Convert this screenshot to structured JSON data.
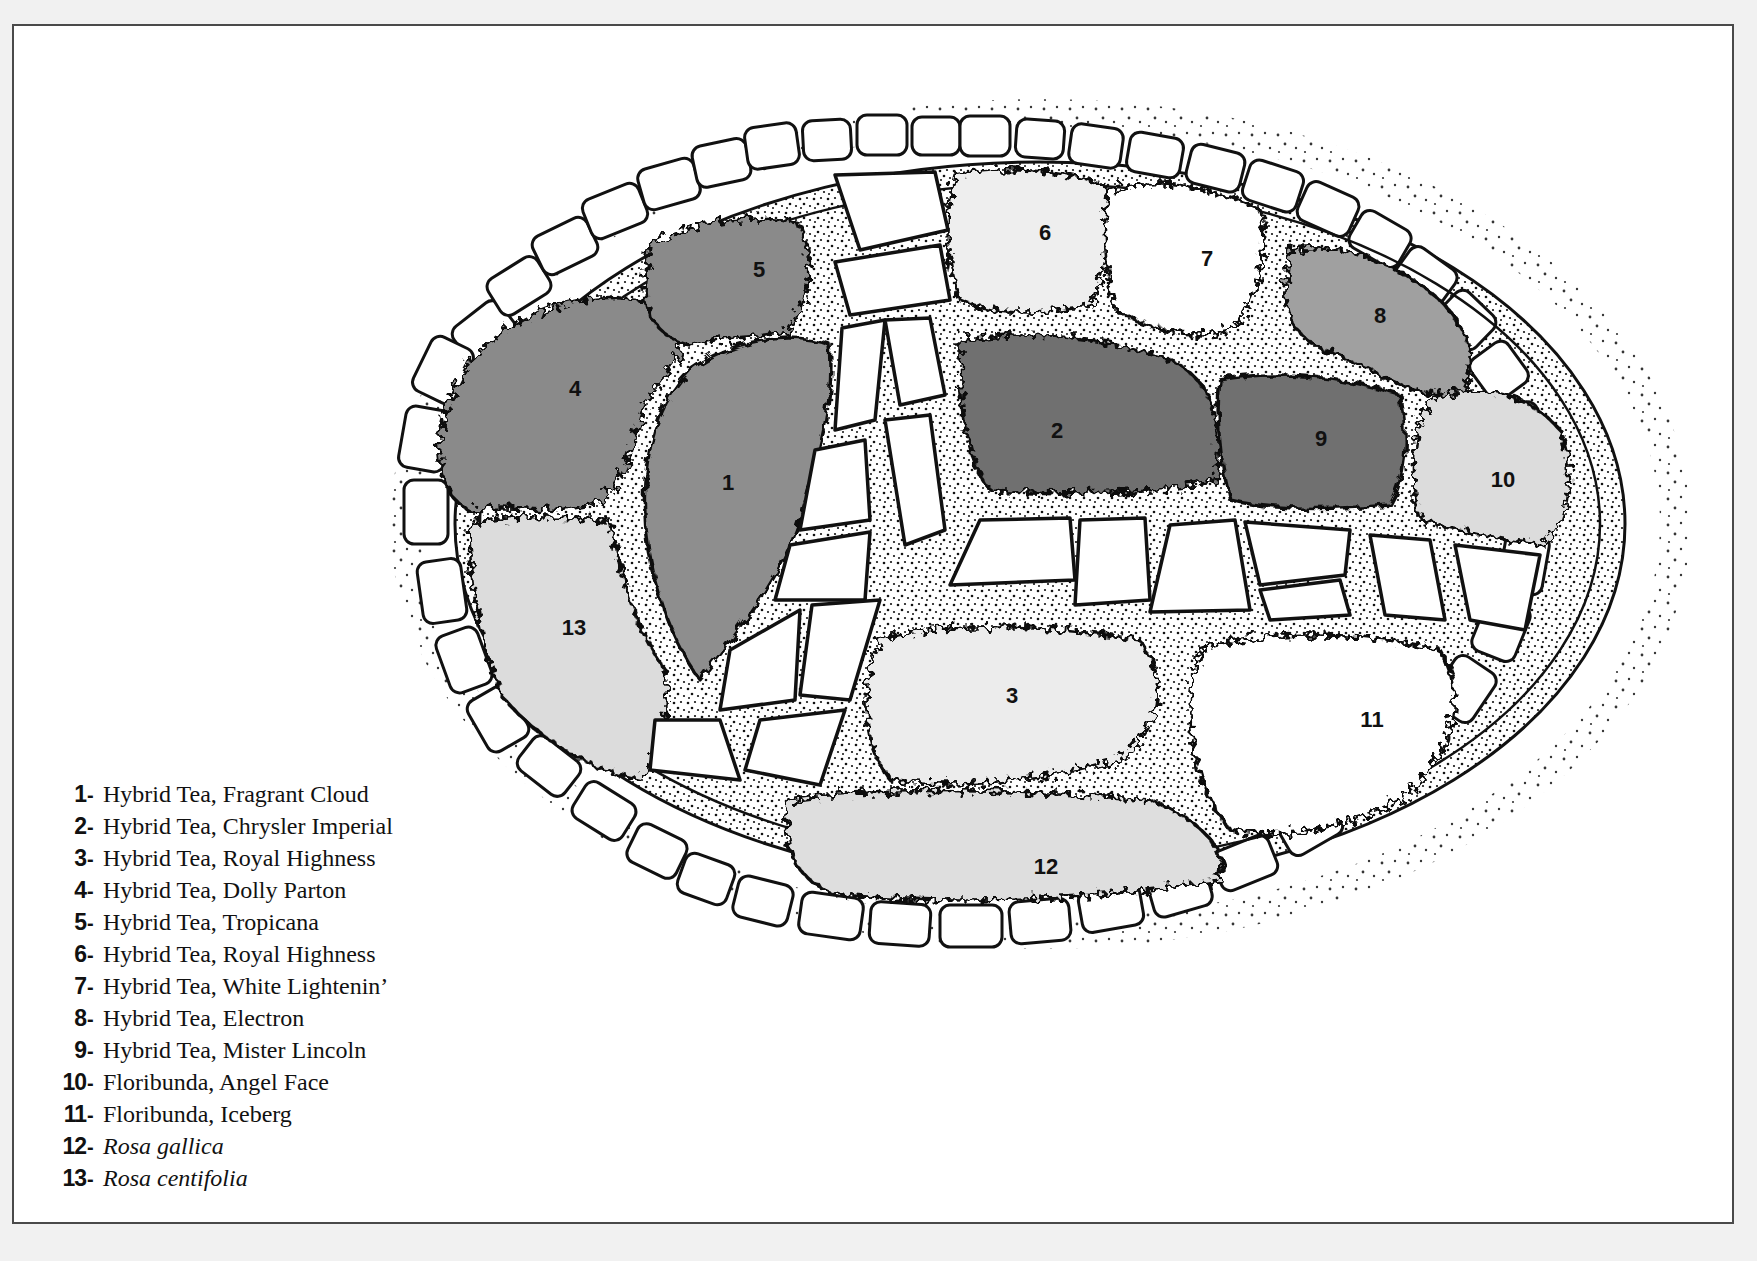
{
  "diagram": {
    "type": "garden-plan",
    "colors": {
      "background": "#f1f1f1",
      "paper": "#ffffff",
      "frame": "#4a4a4a",
      "outline": "#111111",
      "mulch_dots": "#111111",
      "stone_fill": "#ffffff",
      "shade_dark": "#6f6f6f",
      "shade_mid": "#8e8e8e",
      "shade_light": "#d8d8d8",
      "shade_lighter": "#e6e6e6",
      "shade_white": "#ffffff"
    }
  },
  "beds": [
    {
      "id": "1",
      "label": "1",
      "shade": "#8e8e8e",
      "texture": "serrated"
    },
    {
      "id": "2",
      "label": "2",
      "shade": "#6f6f6f",
      "texture": "curled"
    },
    {
      "id": "3",
      "label": "3",
      "shade": "#ececec",
      "texture": "spiky"
    },
    {
      "id": "4",
      "label": "4",
      "shade": "#8a8a8a",
      "texture": "curled"
    },
    {
      "id": "5",
      "label": "5",
      "shade": "#8a8a8a",
      "texture": "serrated"
    },
    {
      "id": "6",
      "label": "6",
      "shade": "#eeeeee",
      "texture": "grassy"
    },
    {
      "id": "7",
      "label": "7",
      "shade": "#ffffff",
      "texture": "curled"
    },
    {
      "id": "8",
      "label": "8",
      "shade": "#a0a0a0",
      "texture": "serrated"
    },
    {
      "id": "9",
      "label": "9",
      "shade": "#6f6f6f",
      "texture": "scalloped"
    },
    {
      "id": "10",
      "label": "10",
      "shade": "#dcdcdc",
      "texture": "fringed"
    },
    {
      "id": "11",
      "label": "11",
      "shade": "#ffffff",
      "texture": "serrated"
    },
    {
      "id": "12",
      "label": "12",
      "shade": "#dedede",
      "texture": "curled"
    },
    {
      "id": "13",
      "label": "13",
      "shade": "#dcdcdc",
      "texture": "curled"
    }
  ],
  "legend": {
    "items": [
      {
        "num": "1",
        "sep": "-",
        "name": "Hybrid Tea, Fragrant Cloud",
        "italic": false
      },
      {
        "num": "2",
        "sep": "-",
        "name": "Hybrid Tea, Chrysler Imperial",
        "italic": false
      },
      {
        "num": "3",
        "sep": "-",
        "name": "Hybrid Tea, Royal Highness",
        "italic": false
      },
      {
        "num": "4",
        "sep": "-",
        "name": "Hybrid Tea, Dolly Parton",
        "italic": false
      },
      {
        "num": "5",
        "sep": "-",
        "name": "Hybrid Tea, Tropicana",
        "italic": false
      },
      {
        "num": "6",
        "sep": "-",
        "name": "Hybrid Tea, Royal Highness",
        "italic": false
      },
      {
        "num": "7",
        "sep": "-",
        "name": "Hybrid Tea, White Lightenin’",
        "italic": false
      },
      {
        "num": "8",
        "sep": "-",
        "name": "Hybrid Tea, Electron",
        "italic": false
      },
      {
        "num": "9",
        "sep": "-",
        "name": "Hybrid Tea, Mister Lincoln",
        "italic": false
      },
      {
        "num": "10",
        "sep": "-",
        "name": "Floribunda, Angel Face",
        "italic": false
      },
      {
        "num": "11",
        "sep": "-",
        "name": "Floribunda, Iceberg",
        "italic": false
      },
      {
        "num": "12",
        "sep": "-",
        "name": "Rosa gallica",
        "italic": true
      },
      {
        "num": "13",
        "sep": "-",
        "name": "Rosa centifolia",
        "italic": true
      }
    ]
  }
}
